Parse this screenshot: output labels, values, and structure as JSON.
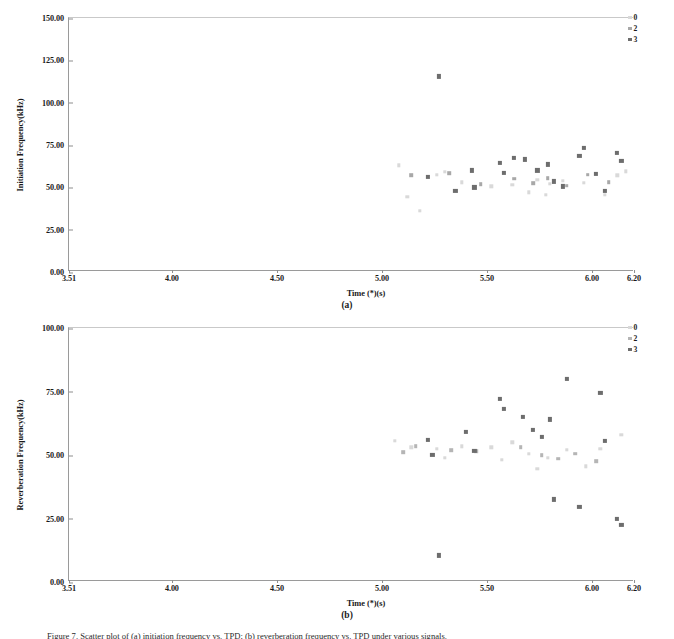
{
  "figure": {
    "caption": "Figure 7. Scatter plot of (a) initiation frequency vs. TPD; (b) reverberation frequency vs. TPD under various signals."
  },
  "panels": [
    {
      "tag": "(a)",
      "chart_data": {
        "type": "scatter",
        "title": "",
        "xlabel": "Time (*)(s)",
        "ylabel": "Initiation Frequency(kHz)",
        "xlim": [
          3.51,
          6.2
        ],
        "ylim": [
          0.0,
          150.0
        ],
        "xticks": [
          "3.51",
          "4.00",
          "4.50",
          "5.00",
          "5.50",
          "6.00",
          "6.20"
        ],
        "xtick_values": [
          3.51,
          4.0,
          4.5,
          5.0,
          5.5,
          6.0,
          6.2
        ],
        "yticks": [
          "0.00",
          "25.00",
          "50.00",
          "75.00",
          "100.00",
          "125.00",
          "150.00"
        ],
        "ytick_values": [
          0,
          25,
          50,
          75,
          100,
          125,
          150
        ],
        "grid": false,
        "legend_position": "outside-top-right",
        "series": [
          {
            "name": "0",
            "color": "#d9d9d9",
            "points": [
              [
                5.08,
                63.0
              ],
              [
                5.12,
                44.5
              ],
              [
                5.18,
                36.0
              ],
              [
                5.26,
                57.5
              ],
              [
                5.3,
                59.0
              ],
              [
                5.38,
                53.0
              ],
              [
                5.52,
                50.5
              ],
              [
                5.62,
                51.5
              ],
              [
                5.7,
                47.0
              ],
              [
                5.74,
                54.5
              ],
              [
                5.78,
                45.5
              ],
              [
                5.8,
                52.0
              ],
              [
                5.86,
                54.0
              ],
              [
                5.96,
                52.5
              ],
              [
                6.06,
                45.5
              ],
              [
                6.12,
                57.0
              ],
              [
                6.16,
                59.5
              ]
            ]
          },
          {
            "name": "2",
            "color": "#a8a8a8",
            "points": [
              [
                5.14,
                57.0
              ],
              [
                5.32,
                58.5
              ],
              [
                5.47,
                52.0
              ],
              [
                5.63,
                55.0
              ],
              [
                5.72,
                52.5
              ],
              [
                5.79,
                55.5
              ],
              [
                5.88,
                51.0
              ],
              [
                5.98,
                57.5
              ],
              [
                6.08,
                53.0
              ]
            ]
          },
          {
            "name": "3",
            "color": "#6d6d6d",
            "points": [
              [
                5.27,
                115.5
              ],
              [
                5.22,
                56.0
              ],
              [
                5.35,
                48.0
              ],
              [
                5.43,
                60.0
              ],
              [
                5.44,
                50.0
              ],
              [
                5.56,
                64.5
              ],
              [
                5.58,
                58.5
              ],
              [
                5.63,
                67.5
              ],
              [
                5.68,
                66.5
              ],
              [
                5.74,
                60.0
              ],
              [
                5.79,
                63.5
              ],
              [
                5.82,
                53.5
              ],
              [
                5.86,
                50.5
              ],
              [
                5.94,
                68.5
              ],
              [
                5.96,
                73.5
              ],
              [
                6.02,
                58.0
              ],
              [
                6.06,
                48.0
              ],
              [
                6.12,
                70.5
              ],
              [
                6.14,
                65.5
              ]
            ]
          }
        ]
      }
    },
    {
      "tag": "(b)",
      "chart_data": {
        "type": "scatter",
        "title": "",
        "xlabel": "Time (*)(s)",
        "ylabel": "Reverberation Frequency(kHz)",
        "xlim": [
          3.51,
          6.2
        ],
        "ylim": [
          0.0,
          100.0
        ],
        "xticks": [
          "3.51",
          "4.00",
          "4.50",
          "5.00",
          "5.50",
          "6.00",
          "6.20"
        ],
        "xtick_values": [
          3.51,
          4.0,
          4.5,
          5.0,
          5.5,
          6.0,
          6.2
        ],
        "yticks": [
          "0.00",
          "25.00",
          "50.00",
          "75.00",
          "100.00"
        ],
        "ytick_values": [
          0,
          25,
          50,
          75,
          100
        ],
        "grid": false,
        "legend_position": "outside-top-right",
        "series": [
          {
            "name": "0",
            "color": "#d9d9d9",
            "points": [
              [
                5.06,
                55.5
              ],
              [
                5.14,
                53.0
              ],
              [
                5.26,
                52.5
              ],
              [
                5.3,
                49.0
              ],
              [
                5.38,
                53.5
              ],
              [
                5.52,
                53.0
              ],
              [
                5.57,
                48.0
              ],
              [
                5.62,
                55.0
              ],
              [
                5.7,
                50.5
              ],
              [
                5.74,
                44.5
              ],
              [
                5.79,
                49.0
              ],
              [
                5.88,
                52.0
              ],
              [
                5.97,
                45.5
              ],
              [
                6.04,
                52.5
              ],
              [
                6.14,
                58.0
              ]
            ]
          },
          {
            "name": "2",
            "color": "#b5b5b5",
            "points": [
              [
                5.1,
                51.0
              ],
              [
                5.16,
                53.5
              ],
              [
                5.33,
                52.0
              ],
              [
                5.45,
                51.5
              ],
              [
                5.66,
                53.0
              ],
              [
                5.76,
                50.0
              ],
              [
                5.84,
                48.5
              ],
              [
                5.92,
                50.5
              ],
              [
                6.02,
                47.5
              ]
            ]
          },
          {
            "name": "3",
            "color": "#6d6d6d",
            "points": [
              [
                5.27,
                10.5
              ],
              [
                5.22,
                56.0
              ],
              [
                5.24,
                50.0
              ],
              [
                5.4,
                59.0
              ],
              [
                5.44,
                51.5
              ],
              [
                5.56,
                72.0
              ],
              [
                5.58,
                68.0
              ],
              [
                5.67,
                65.0
              ],
              [
                5.72,
                60.0
              ],
              [
                5.76,
                57.0
              ],
              [
                5.8,
                64.0
              ],
              [
                5.82,
                32.5
              ],
              [
                5.88,
                80.0
              ],
              [
                5.94,
                29.5
              ],
              [
                6.04,
                74.5
              ],
              [
                6.06,
                55.5
              ],
              [
                6.12,
                25.0
              ],
              [
                6.14,
                22.5
              ]
            ]
          }
        ]
      }
    }
  ]
}
